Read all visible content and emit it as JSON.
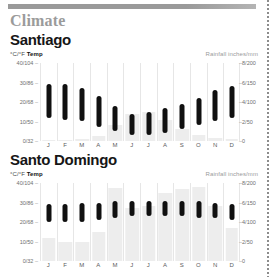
{
  "kicker": "Climate",
  "axis": {
    "left_caption_units": "°C/°F",
    "left_caption_label": "Temp",
    "right_caption": "Rainfall inches/mm",
    "temp_ticks": [
      "40/104",
      "30/86",
      "20/68",
      "10/50",
      "0/32"
    ],
    "rain_ticks": [
      "8/200",
      "6/150",
      "4/100",
      "2/50",
      "0"
    ],
    "months": [
      "J",
      "F",
      "M",
      "A",
      "M",
      "J",
      "J",
      "A",
      "S",
      "O",
      "N",
      "D"
    ]
  },
  "colors": {
    "temp_bar": "#101010",
    "rain_bar": "#ededed",
    "kicker": "#9b9b9b",
    "rule": "#9a9a9a"
  },
  "charts": [
    {
      "city": "Santiago",
      "chart_data": {
        "type": "bar",
        "title": "Santiago",
        "categories": [
          "J",
          "F",
          "M",
          "A",
          "M",
          "J",
          "J",
          "A",
          "S",
          "O",
          "N",
          "D"
        ],
        "xlabel": "",
        "ylabel": "Temp °C/°F",
        "ylim": [
          0,
          40
        ],
        "y2label": "Rainfall inches/mm",
        "y2lim": [
          0,
          8
        ],
        "grid": true,
        "legend": "none",
        "series": [
          {
            "name": "Temp high °C",
            "values": [
              29,
              29,
              27,
              23,
              18,
              14,
              15,
              17,
              19,
              22,
              26,
              28
            ]
          },
          {
            "name": "Temp low °C",
            "values": [
              12,
              11,
              10,
              7,
              5,
              3,
              3,
              4,
              6,
              8,
              10,
              12
            ]
          },
          {
            "name": "Rainfall in",
            "values": [
              0.1,
              0.1,
              0.2,
              0.5,
              1.6,
              2.8,
              3.0,
              2.2,
              1.2,
              0.6,
              0.3,
              0.2
            ]
          }
        ]
      }
    },
    {
      "city": "Santo Domingo",
      "chart_data": {
        "type": "bar",
        "title": "Santo Domingo",
        "categories": [
          "J",
          "F",
          "M",
          "A",
          "M",
          "J",
          "J",
          "A",
          "S",
          "O",
          "N",
          "D"
        ],
        "xlabel": "",
        "ylabel": "Temp °C/°F",
        "ylim": [
          0,
          40
        ],
        "y2label": "Rainfall inches/mm",
        "y2lim": [
          0,
          8
        ],
        "grid": true,
        "legend": "none",
        "series": [
          {
            "name": "Temp high °C",
            "values": [
              29,
              29,
              30,
              30,
              31,
              31,
              31,
              31,
              31,
              31,
              30,
              29
            ]
          },
          {
            "name": "Temp low °C",
            "values": [
              20,
              20,
              20,
              21,
              22,
              23,
              23,
              23,
              23,
              22,
              22,
              21
            ]
          },
          {
            "name": "Rainfall in",
            "values": [
              2.4,
              2.0,
              2.0,
              3.0,
              7.5,
              5.4,
              5.6,
              7.0,
              7.4,
              7.6,
              5.6,
              3.4
            ]
          }
        ]
      }
    }
  ]
}
